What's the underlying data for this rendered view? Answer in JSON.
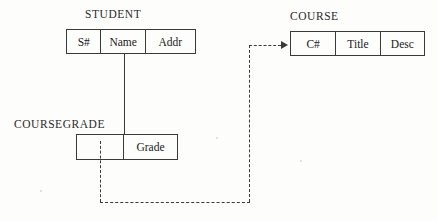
{
  "diagram": {
    "ink_color": "#3a3a3a",
    "background_color": "#fdfdfc",
    "entities": [
      {
        "id": "student",
        "caption": "STUDENT",
        "columns": [
          {
            "label": "S#"
          },
          {
            "label": "Name"
          },
          {
            "label": "Addr"
          }
        ]
      },
      {
        "id": "course",
        "caption": "COURSE",
        "columns": [
          {
            "label": "C#"
          },
          {
            "label": "Title"
          },
          {
            "label": "Desc"
          }
        ]
      },
      {
        "id": "coursegrade",
        "caption": "COURSEGRADE",
        "columns": [
          {
            "label": ""
          },
          {
            "label": "Grade"
          }
        ]
      }
    ],
    "connectors": [
      {
        "id": "student-to-coursegrade",
        "style": "solid",
        "from": "student",
        "to": "coursegrade",
        "arrowhead": "none"
      },
      {
        "id": "coursegrade-to-course",
        "style": "dashed",
        "from": "coursegrade",
        "to": "course",
        "arrowhead": "right"
      }
    ]
  }
}
